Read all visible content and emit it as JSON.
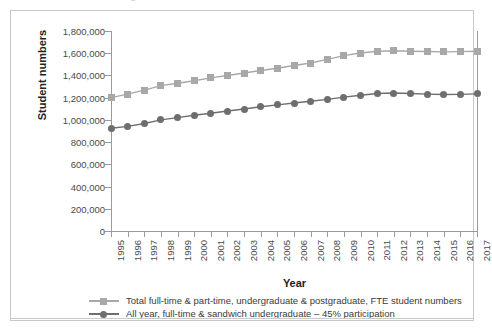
{
  "title_sliver": "Figure",
  "axis": {
    "ylabel": "Student numbers",
    "xlabel": "Year",
    "yticks": [
      "0",
      "200,000",
      "400,000",
      "600,000",
      "800,000",
      "1,000,000",
      "1,200,000",
      "1,400,000",
      "1,600,000",
      "1,800,000"
    ]
  },
  "legend": {
    "items": [
      {
        "label": "Total full-time & part-time, undergraduate & postgraduate, FTE student numbers",
        "marker": "square-marker",
        "color": "#a8a8a8"
      },
      {
        "label": "All year, full-time & sandwich undergraduate – 45% participation",
        "marker": "circle-marker",
        "color": "#6e6e6e"
      }
    ]
  },
  "chart_data": {
    "type": "line",
    "title": "",
    "xlabel": "Year",
    "ylabel": "Student numbers",
    "ylim": [
      0,
      1800000
    ],
    "ytick_step": 200000,
    "grid": false,
    "legend_position": "bottom",
    "categories": [
      1995,
      1996,
      1997,
      1998,
      1999,
      2000,
      2001,
      2002,
      2003,
      2004,
      2005,
      2006,
      2007,
      2008,
      2009,
      2010,
      2011,
      2012,
      2013,
      2014,
      2015,
      2016,
      2017
    ],
    "series": [
      {
        "name": "Total full-time & part-time, undergraduate & postgraduate, FTE student numbers",
        "color": "#a8a8a8",
        "marker": "square",
        "values": [
          1200000,
          1232000,
          1268000,
          1308000,
          1330000,
          1352000,
          1378000,
          1400000,
          1422000,
          1445000,
          1465000,
          1490000,
          1512000,
          1545000,
          1578000,
          1602000,
          1618000,
          1622000,
          1618000,
          1616000,
          1612000,
          1614000,
          1618000
        ]
      },
      {
        "name": "All year, full-time & sandwich undergraduate – 45% participation",
        "color": "#6e6e6e",
        "marker": "circle",
        "values": [
          925000,
          942000,
          968000,
          1000000,
          1020000,
          1042000,
          1060000,
          1080000,
          1098000,
          1118000,
          1135000,
          1152000,
          1168000,
          1185000,
          1205000,
          1222000,
          1238000,
          1242000,
          1238000,
          1232000,
          1228000,
          1230000,
          1234000
        ]
      }
    ]
  }
}
